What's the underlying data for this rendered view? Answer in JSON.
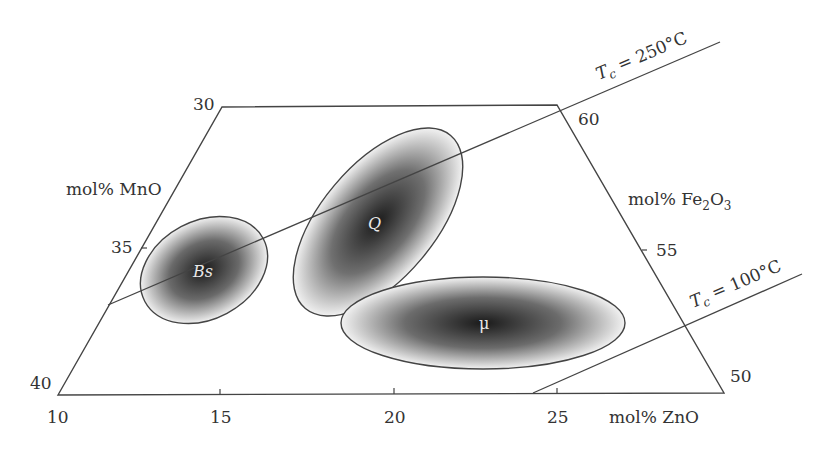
{
  "diagram": {
    "type": "composition-diagram",
    "axes": {
      "left": {
        "label": "mol% MnO",
        "ticks": [
          "30",
          "35",
          "40"
        ]
      },
      "right": {
        "label_prefix": "mol% Fe",
        "label_sub1": "2",
        "label_mid": "O",
        "label_sub2": "3",
        "ticks": [
          "60",
          "55",
          "50"
        ]
      },
      "bottom": {
        "label": "mol% ZnO",
        "ticks": [
          "10",
          "15",
          "20",
          "25"
        ]
      }
    },
    "isotherms": [
      {
        "label_T": "T",
        "label_sub": "c",
        "label_rest": " = 250°C"
      },
      {
        "label_T": "T",
        "label_sub": "c",
        "label_rest": " = 100°C"
      }
    ],
    "regions": [
      {
        "id": "Bs",
        "label": "Bs",
        "italic": true
      },
      {
        "id": "Q",
        "label": "Q",
        "italic": true
      },
      {
        "id": "mu",
        "label": "μ",
        "italic": false
      }
    ],
    "colors": {
      "line": "#444444",
      "text": "#333333",
      "region_dark": "#1a1a1a",
      "region_light": "#f2f2f2"
    }
  }
}
